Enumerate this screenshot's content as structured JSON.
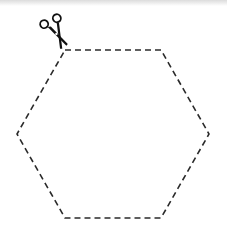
{
  "figure": {
    "shape": "hexagon",
    "vertices": [
      [
        65,
        50
      ],
      [
        161,
        50
      ],
      [
        209,
        134
      ],
      [
        161,
        218
      ],
      [
        65,
        218
      ],
      [
        17,
        134
      ]
    ],
    "line_style": "dashed",
    "stroke_color": "#2a2a2a",
    "dash_pattern": "6 4",
    "icon": "scissors-icon",
    "background": "#ffffff"
  }
}
